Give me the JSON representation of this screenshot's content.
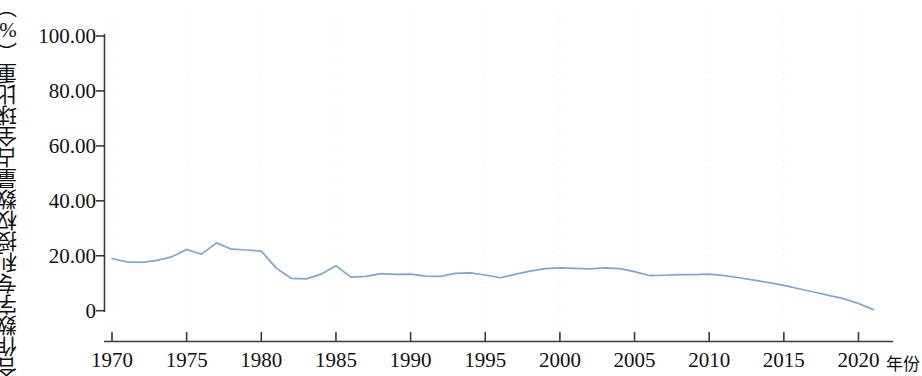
{
  "chart_data": {
    "type": "line",
    "title": "",
    "subtitle": "",
    "ylabel": "合作数字专利授权数量占全球比重（%）",
    "xlabel": "年份",
    "xlim": [
      1969.5,
      2021.5
    ],
    "ylim": [
      0,
      100
    ],
    "grid": "faint dotted vertical gridlines at x ticks",
    "legend": "none",
    "xticks": [
      1970,
      1975,
      1980,
      1985,
      1990,
      1995,
      2000,
      2005,
      2010,
      2015,
      2020
    ],
    "xtick_labels": [
      "1970",
      "1975",
      "1980",
      "1985",
      "1990",
      "1995",
      "2000",
      "2005",
      "2010",
      "2015",
      "2020"
    ],
    "yticks": [
      0,
      20,
      40,
      60,
      80,
      100
    ],
    "ytick_labels": [
      "0",
      "20.00",
      "40.00",
      "60.00",
      "80.00",
      "100.00"
    ],
    "line_color": "#7ba7d4",
    "axis_color": "#3a3a3a",
    "series": [
      {
        "name": "合作数字专利授权数量占全球比重",
        "x": [
          1970,
          1971,
          1972,
          1973,
          1974,
          1975,
          1976,
          1977,
          1978,
          1979,
          1980,
          1981,
          1982,
          1983,
          1984,
          1985,
          1986,
          1987,
          1988,
          1989,
          1990,
          1991,
          1992,
          1993,
          1994,
          1995,
          1996,
          1997,
          1998,
          1999,
          2000,
          2001,
          2002,
          2003,
          2004,
          2005,
          2006,
          2007,
          2008,
          2009,
          2010,
          2011,
          2012,
          2013,
          2014,
          2015,
          2016,
          2017,
          2018,
          2019,
          2020,
          2021
        ],
        "values": [
          19.0,
          17.8,
          17.6,
          18.3,
          19.6,
          22.3,
          20.6,
          24.7,
          22.4,
          22.1,
          21.7,
          15.5,
          11.8,
          11.6,
          13.3,
          16.4,
          12.2,
          12.5,
          13.5,
          13.2,
          13.3,
          12.6,
          12.5,
          13.6,
          13.8,
          13.0,
          12.0,
          13.2,
          14.4,
          15.3,
          15.6,
          15.4,
          15.2,
          15.6,
          15.3,
          14.2,
          12.8,
          12.9,
          13.1,
          13.1,
          13.3,
          12.8,
          12.0,
          11.1,
          10.2,
          9.2,
          8.0,
          6.8,
          5.6,
          4.4,
          2.6,
          0.4
        ]
      }
    ]
  }
}
